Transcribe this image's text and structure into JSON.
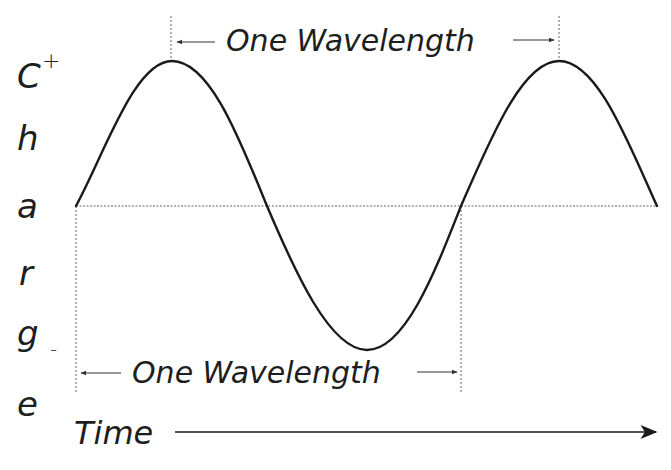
{
  "diagram": {
    "type": "sine-wave-wavelength",
    "y_axis_label_letters": [
      "C",
      "h",
      "a",
      "r",
      "g",
      "e"
    ],
    "y_axis_plus": "+",
    "y_axis_minus": "-",
    "x_axis_label": "Time",
    "top_annotation": "One Wavelength",
    "bottom_annotation": "One Wavelength",
    "colors": {
      "curve": "#1a1a1a",
      "guide": "#555555",
      "text": "#1e1e1e",
      "background": "#ffffff"
    },
    "wave": {
      "cycles": 1.5,
      "start_phase": "zero-crossing-rising",
      "points_px": {
        "start": [
          76,
          206
        ],
        "peak1": [
          172,
          61
        ],
        "zero1": [
          267,
          206
        ],
        "trough": [
          367,
          350
        ],
        "zero2": [
          461,
          206
        ],
        "peak2": [
          559,
          61
        ],
        "end": [
          657,
          206
        ]
      }
    }
  }
}
